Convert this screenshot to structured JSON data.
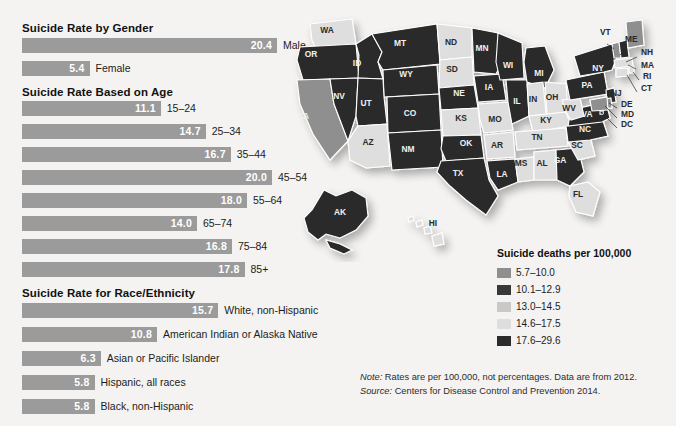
{
  "sections": [
    {
      "id": "gender",
      "title": "Suicide Rate by Gender",
      "rows": [
        {
          "label": "Male",
          "value": "20.4",
          "num": 20.4
        },
        {
          "label": "Female",
          "value": "5.4",
          "num": 5.4
        }
      ]
    },
    {
      "id": "age",
      "title": "Suicide Rate Based on Age",
      "rows": [
        {
          "label": "15–24",
          "value": "11.1",
          "num": 11.1
        },
        {
          "label": "25–34",
          "value": "14.7",
          "num": 14.7
        },
        {
          "label": "35–44",
          "value": "16.7",
          "num": 16.7
        },
        {
          "label": "45–54",
          "value": "20.0",
          "num": 20.0
        },
        {
          "label": "55–64",
          "value": "18.0",
          "num": 18.0
        },
        {
          "label": "65–74",
          "value": "14.0",
          "num": 14.0
        },
        {
          "label": "75–84",
          "value": "16.8",
          "num": 16.8
        },
        {
          "label": "85+",
          "value": "17.8",
          "num": 17.8
        }
      ]
    },
    {
      "id": "race",
      "title": "Suicide Rate for Race/Ethnicity",
      "rows": [
        {
          "label": "White, non-Hispanic",
          "value": "15.7",
          "num": 15.7
        },
        {
          "label": "American Indian or Alaska Native",
          "value": "10.8",
          "num": 10.8
        },
        {
          "label": "Asian or Pacific Islander",
          "value": "6.3",
          "num": 6.3
        },
        {
          "label": "Hispanic, all races",
          "value": "5.8",
          "num": 5.8
        },
        {
          "label": "Black, non-Hispanic",
          "value": "5.8",
          "num": 5.8
        }
      ]
    }
  ],
  "chart_data": {
    "type": "bar",
    "xlabel": "Suicide deaths per 100,000",
    "ylabel": "",
    "xlim": [
      0,
      20.4
    ],
    "grid": false,
    "orientation": "horizontal",
    "groups": [
      {
        "name": "Suicide Rate by Gender",
        "categories": [
          "Male",
          "Female"
        ],
        "values": [
          20.4,
          5.4
        ]
      },
      {
        "name": "Suicide Rate Based on Age",
        "categories": [
          "15-24",
          "25-34",
          "35-44",
          "45-54",
          "55-64",
          "65-74",
          "75-84",
          "85+"
        ],
        "values": [
          11.1,
          14.7,
          16.7,
          20.0,
          18.0,
          14.0,
          16.8,
          17.8
        ]
      },
      {
        "name": "Suicide Rate for Race/Ethnicity",
        "categories": [
          "White, non-Hispanic",
          "American Indian or Alaska Native",
          "Asian or Pacific Islander",
          "Hispanic, all races",
          "Black, non-Hispanic"
        ],
        "values": [
          15.7,
          10.8,
          6.3,
          5.8,
          5.8
        ]
      }
    ],
    "bar_color": "#9b9b9b",
    "map": {
      "type": "choropleth",
      "region": "United States",
      "legend_title": "Suicide deaths per 100,000",
      "bins": [
        {
          "range": "5.7–10.0",
          "color": "#8f8f8f"
        },
        {
          "range": "10.1–12.9",
          "color": "#383838"
        },
        {
          "range": "13.0–14.5",
          "color": "#c9c9c9"
        },
        {
          "range": "14.6–17.5",
          "color": "#dedede"
        },
        {
          "range": "17.6–29.6",
          "color": "#2b2b2b"
        }
      ]
    }
  },
  "legend": {
    "title": "Suicide deaths per 100,000",
    "items": [
      {
        "range": "5.7–10.0",
        "color": "#8f8f8f"
      },
      {
        "range": "10.1–12.9",
        "color": "#383838"
      },
      {
        "range": "13.0–14.5",
        "color": "#c9c9c9"
      },
      {
        "range": "14.6–17.5",
        "color": "#dedede"
      },
      {
        "range": "17.6–29.6",
        "color": "#2b2b2b"
      }
    ]
  },
  "notes": {
    "note_prefix": "Note:",
    "note_text": " Rates are per 100,000, not percentages. Data are from 2012.",
    "source_prefix": "Source:",
    "source_text": " Centers for Disease Control and Prevention 2014."
  },
  "map_states": [
    {
      "abbr": "WA",
      "x": 327,
      "y": 33,
      "tone": "light"
    },
    {
      "abbr": "OR",
      "x": 311,
      "y": 57,
      "tone": "dark"
    },
    {
      "abbr": "CA",
      "x": 303,
      "y": 119,
      "tone": "mid"
    },
    {
      "abbr": "NV",
      "x": 339,
      "y": 99,
      "tone": "dark"
    },
    {
      "abbr": "ID",
      "x": 357,
      "y": 66,
      "tone": "dark"
    },
    {
      "abbr": "MT",
      "x": 400,
      "y": 46,
      "tone": "dark"
    },
    {
      "abbr": "WY",
      "x": 406,
      "y": 77,
      "tone": "dark"
    },
    {
      "abbr": "UT",
      "x": 366,
      "y": 106,
      "tone": "dark"
    },
    {
      "abbr": "CO",
      "x": 410,
      "y": 116,
      "tone": "dark"
    },
    {
      "abbr": "AZ",
      "x": 368,
      "y": 145,
      "tone": "light"
    },
    {
      "abbr": "NM",
      "x": 408,
      "y": 152,
      "tone": "dark"
    },
    {
      "abbr": "ND",
      "x": 451,
      "y": 45,
      "tone": "light"
    },
    {
      "abbr": "SD",
      "x": 452,
      "y": 72,
      "tone": "light"
    },
    {
      "abbr": "NE",
      "x": 459,
      "y": 96,
      "tone": "dark"
    },
    {
      "abbr": "KS",
      "x": 461,
      "y": 121,
      "tone": "light"
    },
    {
      "abbr": "OK",
      "x": 466,
      "y": 146,
      "tone": "dark"
    },
    {
      "abbr": "TX",
      "x": 458,
      "y": 176,
      "tone": "dark"
    },
    {
      "abbr": "MN",
      "x": 482,
      "y": 51,
      "tone": "dark"
    },
    {
      "abbr": "IA",
      "x": 489,
      "y": 90,
      "tone": "dark"
    },
    {
      "abbr": "MO",
      "x": 495,
      "y": 122,
      "tone": "light"
    },
    {
      "abbr": "AR",
      "x": 497,
      "y": 148,
      "tone": "light"
    },
    {
      "abbr": "LA",
      "x": 502,
      "y": 177,
      "tone": "dark"
    },
    {
      "abbr": "WI",
      "x": 508,
      "y": 68,
      "tone": "dark"
    },
    {
      "abbr": "IL",
      "x": 517,
      "y": 104,
      "tone": "dark"
    },
    {
      "abbr": "MS",
      "x": 521,
      "y": 166,
      "tone": "light"
    },
    {
      "abbr": "MI",
      "x": 539,
      "y": 76,
      "tone": "dark"
    },
    {
      "abbr": "IN",
      "x": 533,
      "y": 102,
      "tone": "light"
    },
    {
      "abbr": "KY",
      "x": 546,
      "y": 123,
      "tone": "light"
    },
    {
      "abbr": "TN",
      "x": 537,
      "y": 140,
      "tone": "light"
    },
    {
      "abbr": "AL",
      "x": 542,
      "y": 166,
      "tone": "light"
    },
    {
      "abbr": "OH",
      "x": 552,
      "y": 100,
      "tone": "light"
    },
    {
      "abbr": "GA",
      "x": 560,
      "y": 163,
      "tone": "dark"
    },
    {
      "abbr": "FL",
      "x": 578,
      "y": 197,
      "tone": "light"
    },
    {
      "abbr": "SC",
      "x": 577,
      "y": 148,
      "tone": "light"
    },
    {
      "abbr": "NC",
      "x": 585,
      "y": 132,
      "tone": "dark"
    },
    {
      "abbr": "VA",
      "x": 587,
      "y": 117,
      "tone": "dark"
    },
    {
      "abbr": "WV",
      "x": 569,
      "y": 111,
      "tone": "light"
    },
    {
      "abbr": "PA",
      "x": 587,
      "y": 88,
      "tone": "dark"
    },
    {
      "abbr": "NY",
      "x": 598,
      "y": 71,
      "tone": "dark"
    },
    {
      "abbr": "AK",
      "x": 340,
      "y": 215,
      "tone": "dark"
    },
    {
      "abbr": "HI",
      "x": 433,
      "y": 226,
      "tone": "light"
    }
  ],
  "map_callouts": [
    {
      "abbr": "VT",
      "x": 600,
      "y": 35
    },
    {
      "abbr": "ME",
      "x": 625,
      "y": 42
    },
    {
      "abbr": "NH",
      "x": 641,
      "y": 55
    },
    {
      "abbr": "MA",
      "x": 641,
      "y": 68
    },
    {
      "abbr": "RI",
      "x": 643,
      "y": 79
    },
    {
      "abbr": "CT",
      "x": 641,
      "y": 91
    },
    {
      "abbr": "NJ",
      "x": 611,
      "y": 96
    },
    {
      "abbr": "DE",
      "x": 621,
      "y": 107
    },
    {
      "abbr": "MD",
      "x": 621,
      "y": 117
    },
    {
      "abbr": "DC",
      "x": 621,
      "y": 127
    }
  ]
}
